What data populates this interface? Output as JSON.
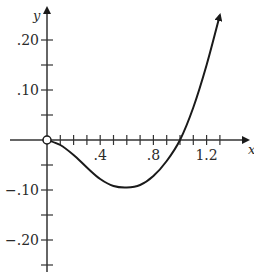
{
  "chart_data": {
    "type": "line",
    "title": "",
    "xlabel": "x",
    "ylabel": "y",
    "xlim": [
      -0.35,
      1.55
    ],
    "ylim": [
      -0.26,
      0.27
    ],
    "grid": false,
    "legend": null,
    "x_ticks": [
      0.1,
      0.2,
      0.3,
      0.4,
      0.5,
      0.6,
      0.7,
      0.8,
      0.9,
      1.0,
      1.1,
      1.2,
      1.3
    ],
    "x_tick_labels": [
      {
        "value": 0.4,
        "label": ".4"
      },
      {
        "value": 0.8,
        "label": ".8"
      },
      {
        "value": 1.2,
        "label": "1.2"
      }
    ],
    "y_ticks": [
      -0.25,
      -0.2,
      -0.15,
      -0.1,
      -0.05,
      0.05,
      0.1,
      0.15,
      0.2
    ],
    "y_tick_labels": [
      {
        "value": 0.2,
        "label": ".20"
      },
      {
        "value": 0.1,
        "label": ".10"
      },
      {
        "value": -0.1,
        "label": "−.10"
      },
      {
        "value": -0.2,
        "label": "−.20"
      }
    ],
    "series": [
      {
        "name": "curve",
        "x": [
          0.0,
          0.1,
          0.2,
          0.3,
          0.4,
          0.5,
          0.6,
          0.7,
          0.8,
          0.9,
          1.0,
          1.1,
          1.2,
          1.3
        ],
        "y": [
          0.0,
          -0.01,
          -0.03,
          -0.055,
          -0.078,
          -0.092,
          -0.095,
          -0.09,
          -0.072,
          -0.042,
          0.0,
          0.065,
          0.15,
          0.25
        ],
        "start_marker": "open-circle",
        "end_marker": "arrow"
      }
    ],
    "annotations": [
      {
        "type": "open-circle",
        "x": 0.0,
        "y": 0.0,
        "note": "origin point excluded"
      }
    ]
  },
  "axes": {
    "x_label": "x",
    "y_label": "y",
    "ticks": {
      "x": [
        ".4",
        ".8",
        "1.2"
      ],
      "y": [
        ".20",
        ".10",
        "−.10",
        "−.20"
      ]
    }
  }
}
